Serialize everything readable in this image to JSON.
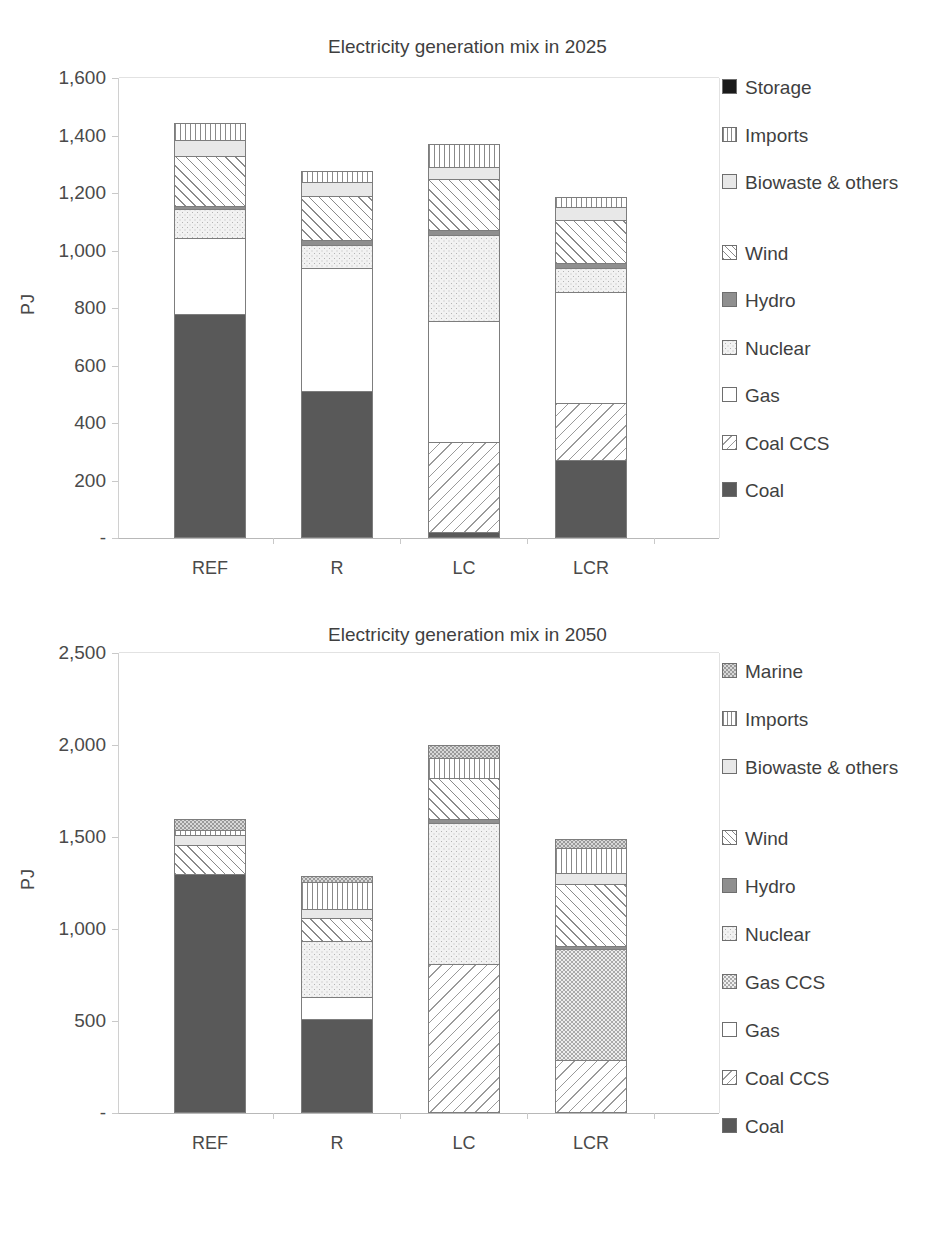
{
  "charts": [
    {
      "id": "chart-2025",
      "title": "Electricity generation mix in 2025",
      "ylabel": "PJ",
      "yticks": [
        "1,600",
        "1,400",
        "1,200",
        "1,000",
        "800",
        "600",
        "400",
        "200",
        "-"
      ],
      "xticks": [
        "REF",
        "R",
        "LC",
        "LCR"
      ],
      "legend": [
        {
          "label": "Storage",
          "fill": "storage"
        },
        {
          "label": "Imports",
          "fill": "imports"
        },
        {
          "label": "Biowaste & others",
          "fill": "biowaste"
        },
        {
          "label": "Wind",
          "fill": "wind"
        },
        {
          "label": "Hydro",
          "fill": "hydro"
        },
        {
          "label": "Nuclear",
          "fill": "nuclear"
        },
        {
          "label": "Gas",
          "fill": "gas"
        },
        {
          "label": "Coal CCS",
          "fill": "coalccs"
        },
        {
          "label": "Coal",
          "fill": "coal"
        }
      ]
    },
    {
      "id": "chart-2050",
      "title": "Electricity generation mix in 2050",
      "ylabel": "PJ",
      "yticks": [
        "2,500",
        "2,000",
        "1,500",
        "1,000",
        "500",
        "-"
      ],
      "xticks": [
        "REF",
        "R",
        "LC",
        "LCR"
      ],
      "legend": [
        {
          "label": "Marine",
          "fill": "marine"
        },
        {
          "label": "Imports",
          "fill": "imports"
        },
        {
          "label": "Biowaste & others",
          "fill": "biowaste"
        },
        {
          "label": "Wind",
          "fill": "wind"
        },
        {
          "label": "Hydro",
          "fill": "hydro"
        },
        {
          "label": "Nuclear",
          "fill": "nuclear"
        },
        {
          "label": "Gas CCS",
          "fill": "gasccs"
        },
        {
          "label": "Gas",
          "fill": "gas"
        },
        {
          "label": "Coal CCS",
          "fill": "coalccs"
        },
        {
          "label": "Coal",
          "fill": "coal"
        }
      ]
    }
  ],
  "chart_data": [
    {
      "type": "bar",
      "stacked": true,
      "title": "Electricity generation mix in 2025",
      "xlabel": "",
      "ylabel": "PJ",
      "ylim": [
        0,
        1600
      ],
      "ytick_values": [
        0,
        200,
        400,
        600,
        800,
        1000,
        1200,
        1400,
        1600
      ],
      "grid": false,
      "legend_position": "right",
      "categories": [
        "REF",
        "R",
        "LC",
        "LCR"
      ],
      "series": [
        {
          "name": "Coal",
          "fill": "coal",
          "values": [
            780,
            510,
            20,
            270
          ]
        },
        {
          "name": "Coal CCS",
          "fill": "coalccs",
          "values": [
            0,
            0,
            315,
            200
          ]
        },
        {
          "name": "Gas",
          "fill": "gas",
          "values": [
            265,
            430,
            420,
            385
          ]
        },
        {
          "name": "Nuclear",
          "fill": "nuclear",
          "values": [
            98,
            80,
            300,
            85
          ]
        },
        {
          "name": "Hydro",
          "fill": "hydro",
          "values": [
            12,
            15,
            15,
            15
          ]
        },
        {
          "name": "Wind",
          "fill": "wind",
          "values": [
            175,
            155,
            180,
            150
          ]
        },
        {
          "name": "Biowaste & others",
          "fill": "biowaste",
          "values": [
            55,
            50,
            40,
            45
          ]
        },
        {
          "name": "Imports",
          "fill": "imports",
          "values": [
            60,
            35,
            80,
            35
          ]
        },
        {
          "name": "Storage",
          "fill": "storage",
          "values": [
            0,
            0,
            0,
            0
          ]
        }
      ],
      "totals": [
        1445,
        1275,
        1370,
        1185
      ]
    },
    {
      "type": "bar",
      "stacked": true,
      "title": "Electricity generation mix in 2050",
      "xlabel": "",
      "ylabel": "PJ",
      "ylim": [
        0,
        2500
      ],
      "ytick_values": [
        0,
        500,
        1000,
        1500,
        2000,
        2500
      ],
      "grid": false,
      "legend_position": "right",
      "categories": [
        "REF",
        "R",
        "LC",
        "LCR"
      ],
      "series": [
        {
          "name": "Coal",
          "fill": "coal",
          "values": [
            1300,
            510,
            0,
            0
          ]
        },
        {
          "name": "Coal CCS",
          "fill": "coalccs",
          "values": [
            0,
            0,
            810,
            290
          ]
        },
        {
          "name": "Gas",
          "fill": "gas",
          "values": [
            0,
            120,
            0,
            0
          ]
        },
        {
          "name": "Gas CCS",
          "fill": "gasccs",
          "values": [
            0,
            0,
            0,
            600
          ]
        },
        {
          "name": "Nuclear",
          "fill": "nuclear",
          "values": [
            0,
            305,
            765,
            0
          ]
        },
        {
          "name": "Hydro",
          "fill": "hydro",
          "values": [
            0,
            0,
            25,
            20
          ]
        },
        {
          "name": "Wind",
          "fill": "wind",
          "values": [
            155,
            125,
            220,
            335
          ]
        },
        {
          "name": "Biowaste & others",
          "fill": "biowaste",
          "values": [
            55,
            50,
            0,
            60
          ]
        },
        {
          "name": "Imports",
          "fill": "imports",
          "values": [
            30,
            145,
            110,
            135
          ]
        },
        {
          "name": "Marine",
          "fill": "marine",
          "values": [
            60,
            35,
            70,
            50
          ]
        }
      ],
      "totals": [
        1600,
        1290,
        2000,
        1490
      ]
    }
  ]
}
